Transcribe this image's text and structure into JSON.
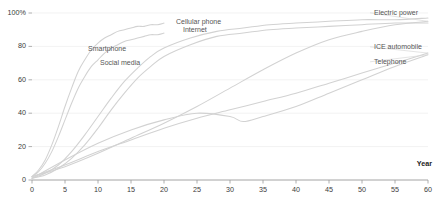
{
  "chart_data": {
    "type": "line",
    "title": "",
    "subtitle": "",
    "xlabel": "Year",
    "ylabel": "",
    "xlim": [
      0,
      60
    ],
    "ylim": [
      0,
      100
    ],
    "grid": true,
    "legend_position": "inline-annotations",
    "x_ticks": [
      0,
      5,
      10,
      15,
      20,
      25,
      30,
      35,
      40,
      45,
      50,
      55,
      60
    ],
    "x_tick_labels": [
      "0",
      "5",
      "10",
      "15",
      "20",
      "25",
      "30",
      "35",
      "40",
      "45",
      "50",
      "55",
      "60"
    ],
    "y_ticks": [
      0,
      20,
      40,
      60,
      80,
      100
    ],
    "y_tick_labels": [
      "0",
      "20",
      "40",
      "60",
      "80",
      "100%"
    ],
    "series": [
      {
        "name": "Smartphone",
        "label_position": "inline",
        "label_x_px": 88,
        "label_y_px": 51,
        "x": [
          0,
          1,
          2,
          3,
          4,
          5,
          6,
          7,
          8,
          9,
          10,
          11,
          12,
          13,
          14,
          15,
          16,
          17,
          18,
          19,
          20
        ],
        "values": [
          2,
          6,
          12,
          21,
          32,
          44,
          55,
          65,
          72,
          78,
          82,
          85,
          87,
          89,
          90,
          91,
          92,
          92,
          93,
          93,
          94
        ]
      },
      {
        "name": "Social media",
        "label_position": "inline",
        "label_x_px": 100,
        "label_y_px": 65,
        "x": [
          0,
          1,
          2,
          3,
          4,
          5,
          6,
          7,
          8,
          9,
          10,
          11,
          12,
          13,
          14,
          15,
          16,
          17,
          18,
          19,
          20
        ],
        "values": [
          2,
          5,
          10,
          17,
          26,
          36,
          46,
          55,
          62,
          68,
          72,
          76,
          79,
          81,
          83,
          84,
          85,
          86,
          87,
          87,
          88
        ]
      },
      {
        "name": "Cellular phone",
        "label_position": "inline",
        "label_x_px": 176,
        "label_y_px": 24,
        "x": [
          0,
          2,
          4,
          6,
          8,
          10,
          12,
          14,
          16,
          18,
          20,
          24,
          28,
          32,
          36,
          40,
          45,
          50,
          55,
          60
        ],
        "values": [
          1,
          4,
          9,
          17,
          27,
          38,
          49,
          59,
          67,
          74,
          79,
          85,
          89,
          91,
          93,
          94,
          95,
          96,
          96,
          97
        ]
      },
      {
        "name": "Internet",
        "label_position": "inline",
        "label_x_px": 183,
        "label_y_px": 32,
        "x": [
          0,
          2,
          4,
          6,
          8,
          10,
          12,
          14,
          16,
          18,
          20,
          24,
          28,
          32,
          36,
          40,
          45,
          50,
          55,
          60
        ],
        "values": [
          1,
          3,
          7,
          13,
          21,
          31,
          42,
          52,
          61,
          68,
          74,
          81,
          86,
          88,
          90,
          91,
          92,
          93,
          94,
          94
        ]
      },
      {
        "name": "Electric power",
        "label_position": "right",
        "label_x_px": 374,
        "label_y_px": 15,
        "x": [
          0,
          5,
          10,
          15,
          20,
          25,
          30,
          35,
          40,
          45,
          50,
          55,
          60
        ],
        "values": [
          2,
          8,
          16,
          25,
          34,
          44,
          55,
          66,
          76,
          84,
          89,
          93,
          95
        ]
      },
      {
        "name": "ICE automobile",
        "label_position": "right",
        "label_x_px": 374,
        "label_y_px": 49,
        "x": [
          0,
          5,
          10,
          15,
          20,
          25,
          30,
          35,
          40,
          45,
          50,
          55,
          60
        ],
        "values": [
          2,
          9,
          17,
          24,
          31,
          37,
          42,
          47,
          52,
          58,
          64,
          70,
          76
        ]
      },
      {
        "name": "Telephone",
        "label_position": "right",
        "label_x_px": 374,
        "label_y_px": 64,
        "x": [
          0,
          5,
          10,
          15,
          20,
          25,
          30,
          32,
          35,
          40,
          45,
          50,
          55,
          60
        ],
        "values": [
          1,
          12,
          22,
          30,
          36,
          40,
          38,
          35,
          38,
          44,
          52,
          60,
          68,
          75
        ]
      }
    ]
  },
  "axis": {
    "x_title": "Year"
  }
}
